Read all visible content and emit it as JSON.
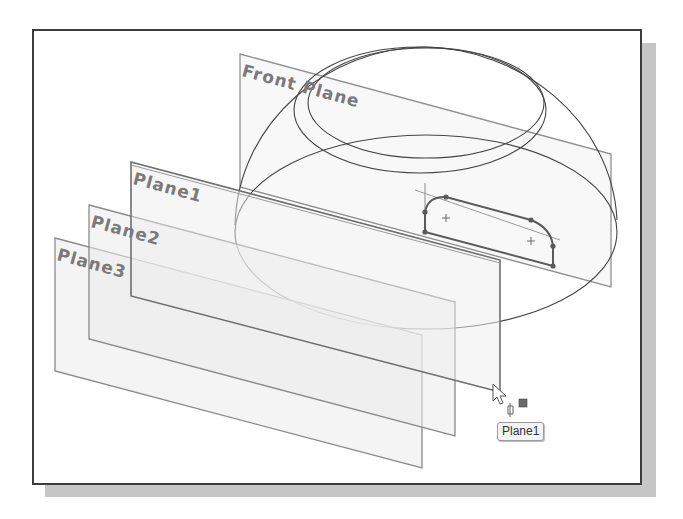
{
  "viewport": {
    "planes": [
      {
        "name": "Front Plane",
        "label": "Front Plane"
      },
      {
        "name": "Plane1",
        "label": "Plane1"
      },
      {
        "name": "Plane2",
        "label": "Plane2"
      },
      {
        "name": "Plane3",
        "label": "Plane3"
      }
    ],
    "tooltip": {
      "text": "Plane1"
    },
    "icons": [
      "arrow-cursor-icon",
      "plane-select-icon"
    ],
    "colors": {
      "frame_border": "#3c3c3c",
      "shadow": "#c6c6c6",
      "plane_edge": "#8a8a8a",
      "plane_fill": "#ececec",
      "sketch": "#555555",
      "label": "#7a7a7a"
    }
  }
}
